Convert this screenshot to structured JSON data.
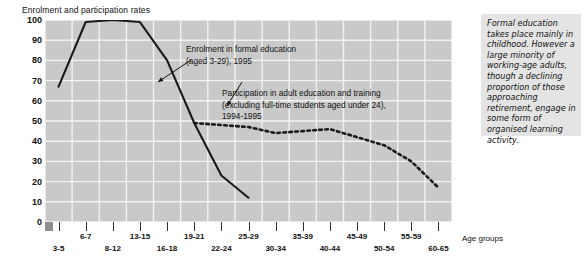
{
  "chart_data": {
    "type": "line",
    "title": "Enrolment and participation rates",
    "xlabel": "Age groups",
    "ylabel": "",
    "ylim": [
      0,
      100
    ],
    "yticks": [
      0,
      10,
      20,
      30,
      40,
      50,
      60,
      70,
      80,
      90,
      100
    ],
    "grid": true,
    "legend_position": "annotations-inline",
    "categories": [
      "3-5",
      "6-7",
      "8-12",
      "13-15",
      "16-18",
      "19-21",
      "22-24",
      "25-29",
      "30-34",
      "35-39",
      "40-44",
      "45-49",
      "50-54",
      "55-59",
      "60-65"
    ],
    "series": [
      {
        "name": "Enrolment in formal education (aged 3-29), 1995",
        "style": "solid",
        "color": "#1a1a1a",
        "values": [
          67,
          99,
          100,
          99,
          80,
          49,
          23,
          12,
          null,
          null,
          null,
          null,
          null,
          null,
          null
        ]
      },
      {
        "name": "Participation in adult education and training (excluding full-time students aged under 24), 1994-1995",
        "style": "dotted",
        "color": "#1a1a1a",
        "values": [
          null,
          null,
          null,
          null,
          null,
          49,
          48,
          47,
          44,
          45,
          46,
          42,
          38,
          30,
          17
        ]
      }
    ],
    "annotations": [
      {
        "id": "enrolment",
        "line1": "Enrolment in formal education",
        "line2": "(aged 3-29), 1995"
      },
      {
        "id": "participation",
        "line1": "Participation in adult education and training",
        "line2": "(excluding full-time students aged under 24),",
        "line3": "1994-1995"
      }
    ]
  },
  "side_note": {
    "text": "Formal education takes place mainly in childhood. However a large minority of working-age adults, though a declining proportion of those approaching retirement, engage in some form of organised learning activity."
  }
}
